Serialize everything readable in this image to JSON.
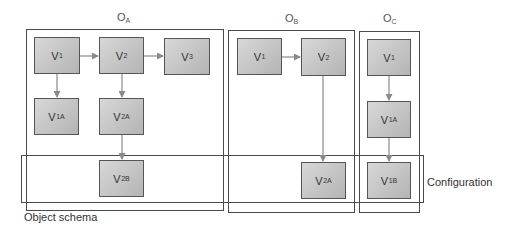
{
  "diagram": {
    "objects": [
      {
        "id": "OA",
        "label_main": "O",
        "label_sub": "A",
        "nodes": [
          {
            "id": "OA-V1",
            "main": "V",
            "sub": "1"
          },
          {
            "id": "OA-V2",
            "main": "V",
            "sub": "2"
          },
          {
            "id": "OA-V3",
            "main": "V",
            "sub": "3"
          },
          {
            "id": "OA-V1A",
            "main": "V",
            "sub": "1A"
          },
          {
            "id": "OA-V2A",
            "main": "V",
            "sub": "2A"
          },
          {
            "id": "OA-V2B",
            "main": "V",
            "sub": "2B"
          }
        ]
      },
      {
        "id": "OB",
        "label_main": "O",
        "label_sub": "B",
        "nodes": [
          {
            "id": "OB-V1",
            "main": "V",
            "sub": "1"
          },
          {
            "id": "OB-V2",
            "main": "V",
            "sub": "2"
          },
          {
            "id": "OB-V2A",
            "main": "V",
            "sub": "2A"
          }
        ]
      },
      {
        "id": "OC",
        "label_main": "O",
        "label_sub": "C",
        "nodes": [
          {
            "id": "OC-V1",
            "main": "V",
            "sub": "1"
          },
          {
            "id": "OC-V1A",
            "main": "V",
            "sub": "1A"
          },
          {
            "id": "OC-V1B",
            "main": "V",
            "sub": "1B"
          }
        ]
      }
    ],
    "edges": [
      {
        "from": "OA-V1",
        "to": "OA-V2"
      },
      {
        "from": "OA-V2",
        "to": "OA-V3"
      },
      {
        "from": "OA-V1",
        "to": "OA-V1A"
      },
      {
        "from": "OA-V2",
        "to": "OA-V2A"
      },
      {
        "from": "OA-V2A",
        "to": "OA-V2B"
      },
      {
        "from": "OB-V1",
        "to": "OB-V2"
      },
      {
        "from": "OB-V2",
        "to": "OB-V2A"
      },
      {
        "from": "OC-V1",
        "to": "OC-V1A"
      },
      {
        "from": "OC-V1A",
        "to": "OC-V1B"
      }
    ],
    "captions": {
      "object_schema": "Object schema",
      "configuration": "Configuration"
    },
    "colors": {
      "frame": "#4a4a4a",
      "node_border": "#555555",
      "node_fill_light": "#d8d8d8",
      "node_fill_dark": "#b4b4b4",
      "arrow": "#8a8a8a"
    }
  }
}
